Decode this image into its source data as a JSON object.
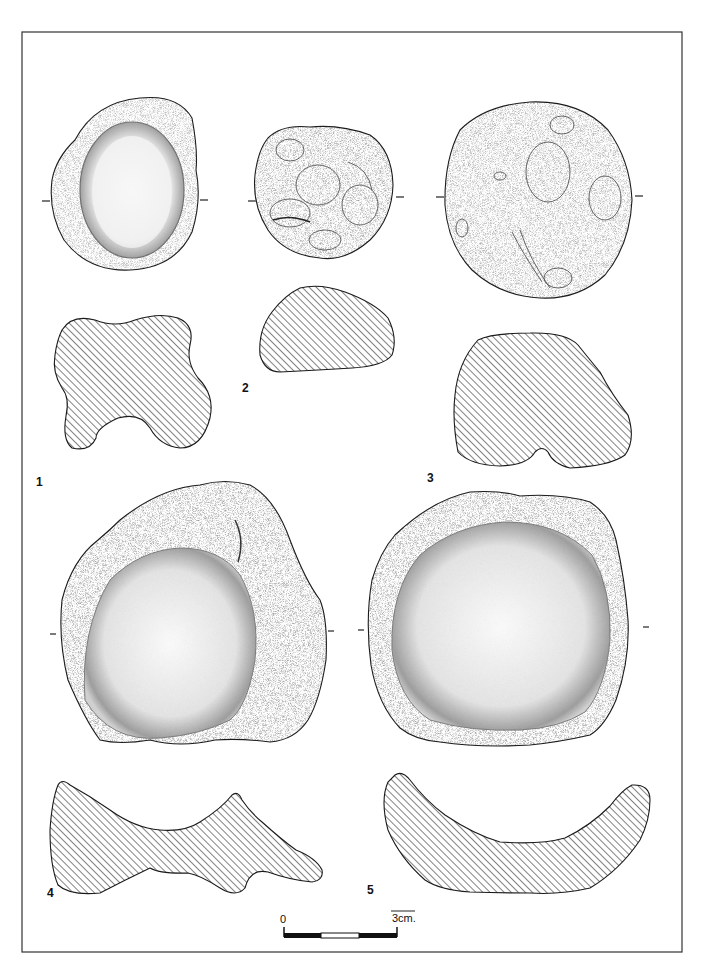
{
  "plate": {
    "frame": {
      "x": 22,
      "y": 32,
      "width": 660,
      "height": 920,
      "stroke": "#333333"
    },
    "figures": [
      {
        "number": "1",
        "label_pos": [
          36,
          484
        ]
      },
      {
        "number": "2",
        "label_pos": [
          242,
          390
        ]
      },
      {
        "number": "3",
        "label_pos": [
          427,
          480
        ]
      },
      {
        "number": "4",
        "label_pos": [
          47,
          895
        ]
      },
      {
        "number": "5",
        "label_pos": [
          367,
          892
        ]
      }
    ],
    "scale_bar": {
      "start_label": "0",
      "end_label": "3cm.",
      "segments": [
        "black",
        "white",
        "black"
      ]
    },
    "colors": {
      "ink": "#1a1a1a",
      "stipple_dark": "#2a2a2a",
      "paper": "#ffffff"
    }
  }
}
